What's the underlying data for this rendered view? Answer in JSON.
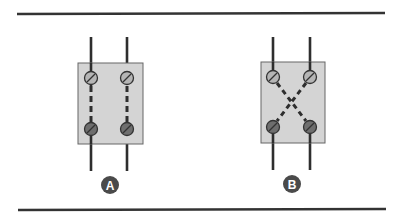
{
  "diagram": {
    "colors": {
      "rail": "#333333",
      "box_fill": "#d4d4d4",
      "box_stroke": "#666666",
      "wire": "#2e2e2e",
      "screw_top": "#b5b5b5",
      "screw_bottom": "#6e6e6e",
      "badge": "#4a4a4a"
    },
    "panels": [
      {
        "id": "A",
        "label": "A",
        "connection": "straight",
        "description": "Parallel dashed internal connections"
      },
      {
        "id": "B",
        "label": "B",
        "connection": "crossed",
        "description": "Crossed dashed internal connections"
      }
    ]
  }
}
